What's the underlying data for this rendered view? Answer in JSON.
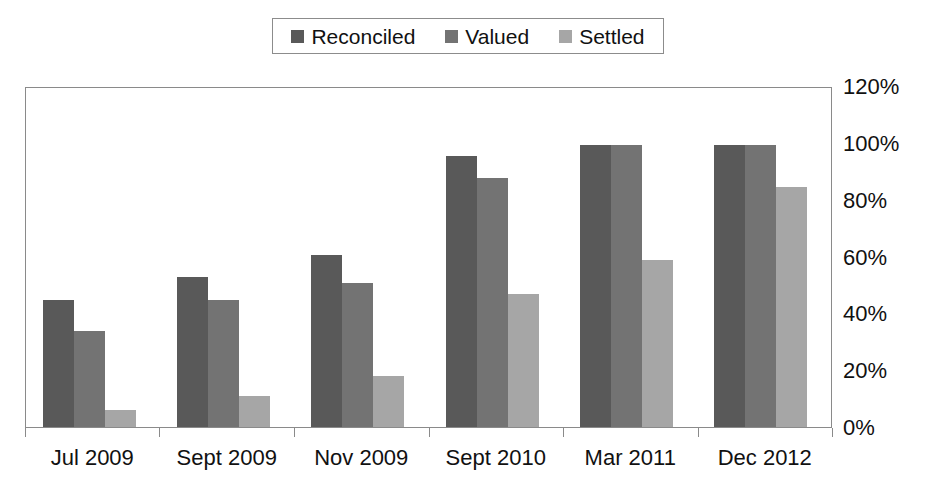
{
  "chart_data": {
    "type": "bar",
    "title": "",
    "xlabel": "",
    "ylabel": "",
    "ylim": [
      0,
      120
    ],
    "y_tick_values": [
      0,
      20,
      40,
      60,
      80,
      100,
      120
    ],
    "y_tick_labels": [
      "0%",
      "20%",
      "40%",
      "60%",
      "80%",
      "100%",
      "120%"
    ],
    "grid": false,
    "legend_position": "top-center",
    "categories": [
      "Jul 2009",
      "Sept 2009",
      "Nov 2009",
      "Sept 2010",
      "Mar 2011",
      "Dec 2012"
    ],
    "series": [
      {
        "name": "Reconciled",
        "color": "#595959",
        "values": [
          45,
          53,
          61,
          96,
          100,
          100
        ]
      },
      {
        "name": "Valued",
        "color": "#737373",
        "values": [
          34,
          45,
          51,
          88,
          100,
          100
        ]
      },
      {
        "name": "Settled",
        "color": "#a6a6a6",
        "values": [
          6,
          11,
          18,
          47,
          59,
          85
        ]
      }
    ]
  },
  "legend": {
    "items": [
      {
        "label": "Reconciled",
        "color": "#595959",
        "swatch": "square-swatch"
      },
      {
        "label": "Valued",
        "color": "#737373",
        "swatch": "square-swatch"
      },
      {
        "label": "Settled",
        "color": "#a6a6a6",
        "swatch": "square-swatch"
      }
    ]
  },
  "colors": {
    "reconciled": "#595959",
    "valued": "#737373",
    "settled": "#a6a6a6",
    "axis": "#8a8a8a",
    "text": "#111111",
    "background": "#ffffff"
  }
}
